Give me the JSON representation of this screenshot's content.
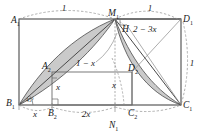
{
  "figure": {
    "type": "geometry-diagram",
    "background": "#ffffff",
    "stroke_color": "#3c3c3c",
    "shade_color": "#c9c9c9",
    "dash_color": "#8a8a8a"
  },
  "points": {
    "A1": {
      "label": "A",
      "sub": "1",
      "x": 19,
      "y": 19
    },
    "M1": {
      "label": "M",
      "sub": "1",
      "x": 115,
      "y": 19
    },
    "D1": {
      "label": "D",
      "sub": "1",
      "x": 181,
      "y": 19
    },
    "B1": {
      "label": "B",
      "sub": "1",
      "x": 19,
      "y": 105
    },
    "C1": {
      "label": "C",
      "sub": "1",
      "x": 181,
      "y": 105
    },
    "A2": {
      "label": "A",
      "sub": "2",
      "x": 52,
      "y": 72
    },
    "D2": {
      "label": "D",
      "sub": "2",
      "x": 132,
      "y": 72
    },
    "B2": {
      "label": "B",
      "sub": "2",
      "x": 52,
      "y": 105
    },
    "C2": {
      "label": "C",
      "sub": "2",
      "x": 132,
      "y": 105
    },
    "N1": {
      "label": "N",
      "sub": "1",
      "x": 115,
      "y": 105
    },
    "H": {
      "label": "H",
      "sub": "",
      "x": 126,
      "y": 28
    }
  },
  "dimensions": {
    "top_left_arc": "1",
    "top_right_arc": "1",
    "right_arc": "1",
    "segment_b1_b2": "x",
    "segment_b2_n1": "2x",
    "segment_h_d1": "2 − 3x",
    "segment_inner_vertical": "x",
    "segment_a2_pointer": "1 − x",
    "segment_c2_vertical": "x",
    "angle_at_b1": "45°"
  },
  "labels": {
    "one": "1",
    "x": "x",
    "two_x": "2x",
    "one_minus_x": "1 − x",
    "two_minus_three_x": "2 − 3x",
    "forty_five_deg": "45°"
  }
}
